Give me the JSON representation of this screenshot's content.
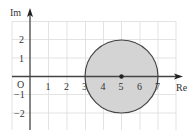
{
  "diagram": {
    "type": "argand-diagram",
    "axes": {
      "x_label": "Re",
      "y_label": "Im",
      "origin_label": "O",
      "x_ticks": [
        "1",
        "2",
        "3",
        "4",
        "5",
        "6",
        "7"
      ],
      "y_ticks_positive": [
        "2",
        "1"
      ],
      "y_ticks_negative": [
        "−1",
        "−2"
      ]
    },
    "circle": {
      "center": [
        5,
        0
      ],
      "radius": 2,
      "fill": "#d4d4d4",
      "stroke": "#444444"
    },
    "center_point": [
      5,
      0
    ],
    "grid": {
      "x_range": [
        0,
        8
      ],
      "y_range": [
        -3,
        3
      ],
      "color": "#dddddd"
    }
  }
}
